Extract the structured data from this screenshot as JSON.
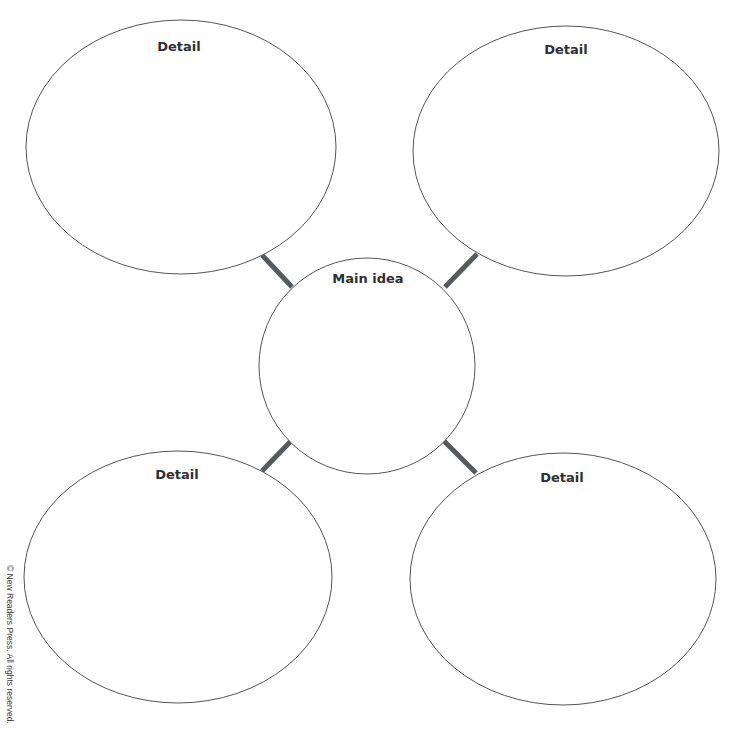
{
  "diagram": {
    "type": "main-idea-and-details web",
    "center": {
      "label": "Main idea"
    },
    "details": [
      {
        "position": "top-left",
        "label": "Detail"
      },
      {
        "position": "top-right",
        "label": "Detail"
      },
      {
        "position": "bottom-left",
        "label": "Detail"
      },
      {
        "position": "bottom-right",
        "label": "Detail"
      }
    ],
    "colors": {
      "outline": "#555555",
      "connector": "#555a5f",
      "text": "#2e3033"
    }
  },
  "footer": {
    "copyright": "© New Readers Press. All rights reserved."
  }
}
